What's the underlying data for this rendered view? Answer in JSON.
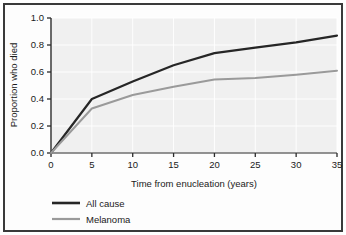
{
  "figure": {
    "background_color": "#ffffff",
    "border_color": "#3a3a3a",
    "plot_background_color": "#f0f0f0",
    "gridline_color": "#ffffff"
  },
  "chart_data": {
    "type": "line",
    "title": "",
    "xlabel": "Time from enucleation (years)",
    "ylabel": "Proportion who died",
    "xlim": [
      0,
      35
    ],
    "ylim": [
      0,
      1.0
    ],
    "xticks": [
      0,
      5,
      10,
      15,
      20,
      25,
      30,
      35
    ],
    "xtick_labels": [
      "0",
      "5",
      "10",
      "15",
      "20",
      "25",
      "30",
      "35"
    ],
    "yticks": [
      0.0,
      0.2,
      0.4,
      0.6,
      0.8,
      1.0
    ],
    "ytick_labels": [
      "0.0",
      "0.2",
      "0.4",
      "0.6",
      "0.8",
      "1.0"
    ],
    "grid": true,
    "legend_position": "below-left",
    "x": [
      0,
      5,
      10,
      15,
      20,
      25,
      30,
      35
    ],
    "series": [
      {
        "name": "All cause",
        "color": "#262626",
        "line_width": 2.2,
        "values": [
          0.0,
          0.4,
          0.53,
          0.65,
          0.74,
          0.78,
          0.82,
          0.87
        ]
      },
      {
        "name": "Melanoma",
        "color": "#9a9a9a",
        "line_width": 2.0,
        "values": [
          0.0,
          0.33,
          0.43,
          0.49,
          0.545,
          0.555,
          0.58,
          0.61
        ]
      }
    ]
  },
  "legend": {
    "items": [
      {
        "label": "All cause",
        "color": "#262626"
      },
      {
        "label": "Melanoma",
        "color": "#9a9a9a"
      }
    ]
  }
}
